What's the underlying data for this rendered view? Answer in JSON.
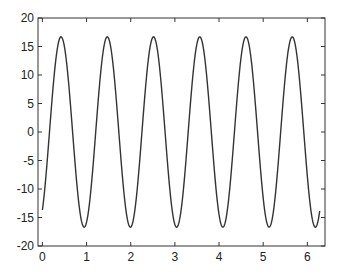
{
  "chart_data": {
    "type": "line",
    "title": "",
    "xlabel": "",
    "ylabel": "",
    "xlim": [
      -0.1,
      6.4
    ],
    "ylim": [
      -20,
      20
    ],
    "grid": false,
    "legend": null,
    "x_ticks": [
      0,
      1,
      2,
      3,
      4,
      5,
      6
    ],
    "y_ticks": [
      -20,
      -15,
      -10,
      -5,
      0,
      5,
      10,
      15,
      20
    ],
    "series": [
      {
        "name": "signal",
        "function": "16.7*sin(6*x - 0.96)",
        "x_range": [
          0,
          6.28
        ],
        "amplitude": 16.7,
        "period": 1.047,
        "start_value": -13.7,
        "end_value": -13.7,
        "color": "#333333"
      }
    ]
  }
}
